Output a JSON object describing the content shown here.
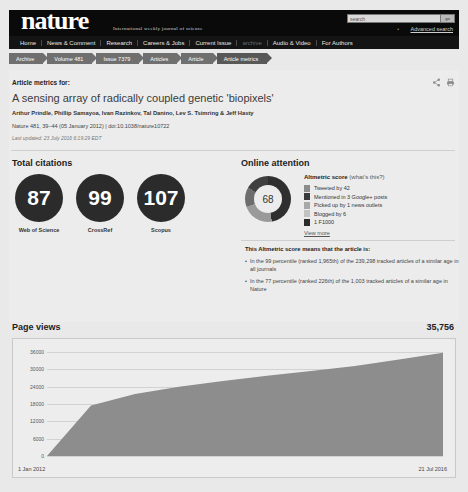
{
  "header": {
    "logo": "nature",
    "tagline": "International weekly journal of science",
    "search_placeholder": "search",
    "search_value": "",
    "go_label": "go",
    "advanced_search": "Advanced search",
    "nav": [
      {
        "label": "Home",
        "dim": false
      },
      {
        "label": "News & Comment",
        "dim": false
      },
      {
        "label": "Research",
        "dim": false
      },
      {
        "label": "Careers & Jobs",
        "dim": false
      },
      {
        "label": "Current Issue",
        "dim": false
      },
      {
        "label": "archive",
        "dim": true
      },
      {
        "label": "Audio & Video",
        "dim": false
      },
      {
        "label": "For Authors",
        "dim": false
      }
    ]
  },
  "breadcrumb": [
    {
      "label": "Archive"
    },
    {
      "label": "Volume 481"
    },
    {
      "label": "Issue 7379"
    },
    {
      "label": "Articles"
    },
    {
      "label": "Article"
    },
    {
      "label": "Article metrics"
    }
  ],
  "article": {
    "metrics_for": "Article metrics for:",
    "title": "A sensing array of radically coupled genetic 'biopixels'",
    "authors": "Arthur Prindle, Phillip Samayoa, Ivan Razinkov, Tal Danino, Lev S. Tsimring & Jeff Hasty",
    "journal": "Nature",
    "volume": "481",
    "pages": "39–44",
    "date": "(05 January 2012)",
    "doi": "doi:10.1038/nature10722",
    "citation_line": "Nature 481, 39–44 (05 January 2012)  |  doi:10.1038/nature10722",
    "last_updated": "Last updated: 23 July 2016 6:19:29 EDT",
    "share_icon": "share-icon",
    "print_icon": "print-icon"
  },
  "total_citations": {
    "heading": "Total citations",
    "items": [
      {
        "value": "87",
        "label": "Web of Science"
      },
      {
        "value": "99",
        "label": "CrossRef"
      },
      {
        "value": "107",
        "label": "Scopus"
      }
    ]
  },
  "online_attention": {
    "heading": "Online attention",
    "score": "68",
    "score_label": "Altmetric score",
    "whats_this": "(what's this?)",
    "legend": [
      {
        "text": "Tweeted by 42",
        "color": "#8c8c8c"
      },
      {
        "text": "Mentioned in 3 Google+ posts",
        "color": "#3a3a3a"
      },
      {
        "text": "Picked up by 1 news outlets",
        "color": "#a8a8a8"
      },
      {
        "text": "Blogged by 6",
        "color": "#c2c2c2"
      },
      {
        "text": "1 F1000",
        "color": "#2b2b2b"
      }
    ],
    "view_more": "View more",
    "means_heading": "This Altmetric score means that the article is:",
    "bullets": [
      "In the 99 percentile (ranked 1,965th) of the 239,298 tracked articles of a similar age in all journals",
      "In the 77 percentile (ranked 226th) of the 1,003 tracked articles of a similar age in Nature"
    ]
  },
  "chart_data": {
    "type": "area",
    "title": "Page views",
    "total": "35,756",
    "xlabel": "",
    "ylabel": "",
    "ylim": [
      0,
      36000
    ],
    "yticks": [
      "36000",
      "30000",
      "24000",
      "18000",
      "12000",
      "6000",
      "0"
    ],
    "xticks": [
      "1 Jan 2012",
      "21 Jul 2016"
    ],
    "grid": true,
    "x": [
      "1 Jan 2012",
      "1 Jul 2012",
      "1 Jan 2013",
      "1 Jul 2013",
      "1 Jan 2014",
      "1 Jul 2014",
      "1 Jan 2015",
      "1 Jul 2015",
      "1 Jan 2016",
      "21 Jul 2016"
    ],
    "values": [
      0,
      17500,
      21500,
      24000,
      26000,
      27800,
      29400,
      31200,
      33400,
      35756
    ]
  }
}
